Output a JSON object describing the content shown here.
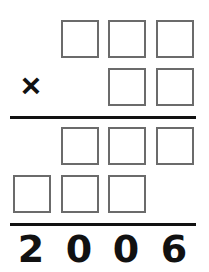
{
  "puzzle": {
    "type": "long-multiplication-cryptarithm",
    "operator": "×",
    "multiplicand_boxes": 3,
    "multiplier_boxes": 2,
    "partial_product_1_boxes": 3,
    "partial_product_2_boxes": 3,
    "result_digits": [
      "2",
      "0",
      "0",
      "6"
    ],
    "box_border_color": "#6b6b6b",
    "rule_color": "#111111"
  }
}
